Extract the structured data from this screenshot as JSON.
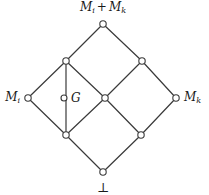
{
  "diagram": {
    "kind": "hasse-lattice",
    "title_label": "",
    "stroke_color": "#3a3a3a",
    "node_fill_color": "#ffffff",
    "node_stroke_color": "#3a3a3a",
    "background_color": "#ffffff",
    "text_color": "#1a1a1a",
    "labels": {
      "top": "M_i + M_k",
      "top_main": "M",
      "top_sub_1": "i",
      "top_op": "+",
      "top_main_2": "M",
      "top_sub_2": "k",
      "left": "M_i",
      "left_main": "M",
      "left_sub": "i",
      "right": "M_k",
      "right_main": "M",
      "right_sub": "k",
      "center_named": "G",
      "bottom": "⊥"
    },
    "nodes": [
      {
        "id": "top",
        "label": "M_i + M_k",
        "x": 103,
        "y": 24,
        "r": 3.2
      },
      {
        "id": "ul",
        "label": "",
        "x": 66,
        "y": 61,
        "r": 3.2
      },
      {
        "id": "ur",
        "label": "",
        "x": 142,
        "y": 61,
        "r": 3.2
      },
      {
        "id": "left",
        "label": "M_i",
        "x": 28,
        "y": 98,
        "r": 3.2
      },
      {
        "id": "g",
        "label": "G",
        "x": 64,
        "y": 98,
        "r": 3.0
      },
      {
        "id": "mid",
        "label": "",
        "x": 105,
        "y": 98,
        "r": 3.2
      },
      {
        "id": "right",
        "label": "M_k",
        "x": 176,
        "y": 98,
        "r": 3.2
      },
      {
        "id": "ll",
        "label": "",
        "x": 66,
        "y": 135,
        "r": 3.2
      },
      {
        "id": "lr",
        "label": "",
        "x": 141,
        "y": 135,
        "r": 3.2
      },
      {
        "id": "bot",
        "label": "⊥",
        "x": 103,
        "y": 172,
        "r": 3.2
      }
    ],
    "edges": [
      {
        "from": "ul",
        "to": "top"
      },
      {
        "from": "ur",
        "to": "top"
      },
      {
        "from": "left",
        "to": "ul"
      },
      {
        "from": "mid",
        "to": "ul"
      },
      {
        "from": "mid",
        "to": "ur"
      },
      {
        "from": "right",
        "to": "ur"
      },
      {
        "from": "ll",
        "to": "left"
      },
      {
        "from": "ll",
        "to": "mid"
      },
      {
        "from": "lr",
        "to": "mid"
      },
      {
        "from": "lr",
        "to": "right"
      },
      {
        "from": "bot",
        "to": "ll"
      },
      {
        "from": "bot",
        "to": "lr"
      },
      {
        "from": "ll",
        "to": "ul"
      }
    ]
  }
}
